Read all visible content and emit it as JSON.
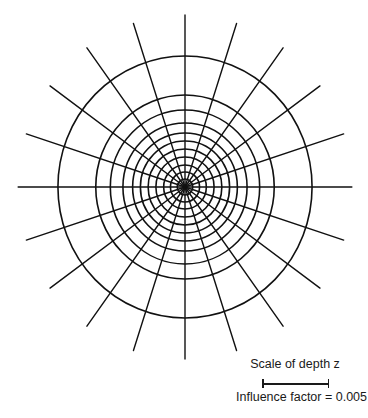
{
  "diagram": {
    "type": "influence-chart",
    "center": {
      "x": 185,
      "y": 187
    },
    "ellipse_x_scale": 0.97,
    "circle_radii": [
      8,
      15,
      22,
      30,
      38,
      46,
      54,
      64,
      77,
      92,
      131
    ],
    "radial_line_count": 20,
    "radial_angle_step_deg": 18,
    "radial_line_length": 172,
    "stroke_color": "#111111",
    "circle_stroke_width": 1.6,
    "radial_stroke_width": 1.4
  },
  "scale": {
    "title": "Scale of depth z",
    "influence_label": "Influence factor = 0.005",
    "influence_factor": 0.005
  }
}
